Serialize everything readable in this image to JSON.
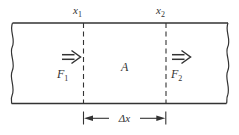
{
  "figure": {
    "background": "#ffffff",
    "ink_color": "#333333",
    "labels": {
      "x1": {
        "base": "x",
        "sub": "1"
      },
      "x2": {
        "base": "x",
        "sub": "2"
      },
      "f1": {
        "base": "F",
        "sub": "1"
      },
      "f2": {
        "base": "F",
        "sub": "2"
      },
      "area": "A",
      "delta_x": "Δx"
    }
  }
}
